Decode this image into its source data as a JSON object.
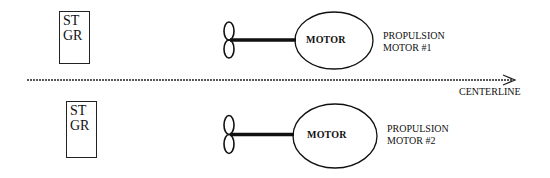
{
  "diagram": {
    "starboard_gear": [
      {
        "line1": "ST",
        "line2": "GR"
      },
      {
        "line1": "ST",
        "line2": "GR"
      }
    ],
    "motors": [
      {
        "name": "MOTOR",
        "label_line1": "PROPULSION",
        "label_line2": "MOTOR #1"
      },
      {
        "name": "MOTOR",
        "label_line1": "PROPULSION",
        "label_line2": "MOTOR #2"
      }
    ],
    "centerline_label": "CENTERLINE"
  }
}
